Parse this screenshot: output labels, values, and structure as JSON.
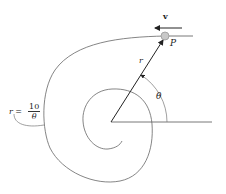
{
  "diagram": {
    "labels": {
      "velocity": "v",
      "point": "P",
      "radius": "r",
      "angle": "θ"
    },
    "equation": {
      "lhs": "r =",
      "numerator": "10",
      "denominator": "θ"
    },
    "colors": {
      "line": "#555555",
      "arrow": "#222222",
      "particle_fill": "#c8c8c8",
      "particle_stroke": "#999999",
      "text": "#222222"
    }
  }
}
